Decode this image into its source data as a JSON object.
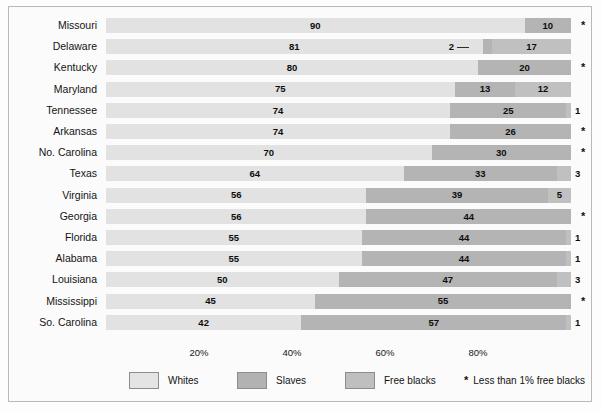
{
  "chart_data": {
    "type": "bar",
    "title": "",
    "subtitle": "",
    "xlabel": "",
    "ylabel": "",
    "orientation": "horizontal",
    "stacked": true,
    "stack_mode": "percent",
    "xlim": [
      0,
      100
    ],
    "grid": false,
    "legend_position": "bottom",
    "tick_labels": [
      "20%",
      "40%",
      "60%",
      "80%"
    ],
    "tick_values": [
      20,
      40,
      60,
      80
    ],
    "categories": [
      "Missouri",
      "Delaware",
      "Kentucky",
      "Maryland",
      "Tennessee",
      "Arkansas",
      "No. Carolina",
      "Texas",
      "Virginia",
      "Georgia",
      "Florida",
      "Alabama",
      "Louisiana",
      "Mississippi",
      "So. Carolina"
    ],
    "series": [
      {
        "name": "Whites",
        "color": "#e2e2e2",
        "values": [
          90,
          81,
          80,
          75,
          74,
          74,
          70,
          64,
          56,
          56,
          55,
          55,
          50,
          45,
          42
        ]
      },
      {
        "name": "Slaves",
        "color": "#b4b4b4",
        "values": [
          10,
          2,
          20,
          13,
          25,
          26,
          30,
          33,
          39,
          44,
          44,
          44,
          47,
          55,
          57
        ]
      },
      {
        "name": "Free blacks",
        "color": "#c0c0c0",
        "values": [
          0,
          17,
          0,
          12,
          1,
          0,
          0,
          3,
          5,
          0,
          1,
          1,
          3,
          0,
          1
        ]
      }
    ],
    "rows": [
      {
        "state": "Missouri",
        "whites": 90,
        "slaves": 10,
        "free": 0,
        "free_label": "*",
        "free_star": true,
        "callout": false
      },
      {
        "state": "Delaware",
        "whites": 81,
        "slaves": 2,
        "free": 17,
        "free_label": "17",
        "free_star": false,
        "callout": true,
        "callout_label": "2"
      },
      {
        "state": "Kentucky",
        "whites": 80,
        "slaves": 20,
        "free": 0,
        "free_label": "*",
        "free_star": true,
        "callout": false
      },
      {
        "state": "Maryland",
        "whites": 75,
        "slaves": 13,
        "free": 12,
        "free_label": "12",
        "free_star": false,
        "callout": false
      },
      {
        "state": "Tennessee",
        "whites": 74,
        "slaves": 25,
        "free": 1,
        "free_label": "1",
        "free_star": false,
        "callout": false
      },
      {
        "state": "Arkansas",
        "whites": 74,
        "slaves": 26,
        "free": 0,
        "free_label": "*",
        "free_star": true,
        "callout": false
      },
      {
        "state": "No. Carolina",
        "whites": 70,
        "slaves": 30,
        "free": 0,
        "free_label": "*",
        "free_star": true,
        "callout": false
      },
      {
        "state": "Texas",
        "whites": 64,
        "slaves": 33,
        "free": 3,
        "free_label": "3",
        "free_star": false,
        "callout": false
      },
      {
        "state": "Virginia",
        "whites": 56,
        "slaves": 39,
        "free": 5,
        "free_label": "5",
        "free_star": false,
        "callout": false
      },
      {
        "state": "Georgia",
        "whites": 56,
        "slaves": 44,
        "free": 0,
        "free_label": "*",
        "free_star": true,
        "callout": false
      },
      {
        "state": "Florida",
        "whites": 55,
        "slaves": 44,
        "free": 1,
        "free_label": "1",
        "free_star": false,
        "callout": false
      },
      {
        "state": "Alabama",
        "whites": 55,
        "slaves": 44,
        "free": 1,
        "free_label": "1",
        "free_star": false,
        "callout": false
      },
      {
        "state": "Louisiana",
        "whites": 50,
        "slaves": 47,
        "free": 3,
        "free_label": "3",
        "free_star": false,
        "callout": false
      },
      {
        "state": "Mississippi",
        "whites": 45,
        "slaves": 55,
        "free": 0,
        "free_label": "*",
        "free_star": true,
        "callout": false
      },
      {
        "state": "So. Carolina",
        "whites": 42,
        "slaves": 57,
        "free": 1,
        "free_label": "1",
        "free_star": false,
        "callout": false
      }
    ],
    "legend": [
      {
        "label": "Whites",
        "color": "#e4e4e4"
      },
      {
        "label": "Slaves",
        "color": "#b2b2b2"
      },
      {
        "label": "Free blacks",
        "color": "#bfbfbf"
      }
    ],
    "footnote_symbol": "*",
    "footnote": "Less than 1% free blacks"
  }
}
